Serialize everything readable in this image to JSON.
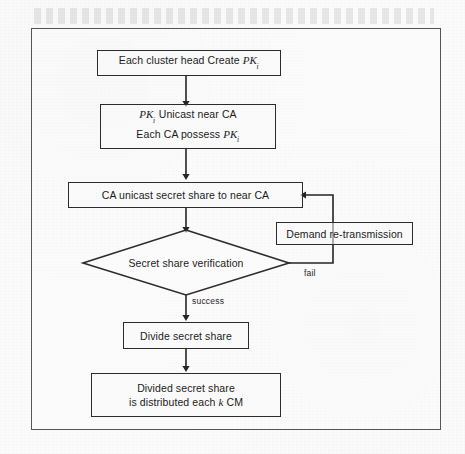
{
  "figure": {
    "type": "flowchart",
    "background_color": "#fbfbfb",
    "frame_color": "#555555",
    "node_border_color": "#2c2c2c",
    "text_color": "#1b1b1b"
  },
  "nodes": {
    "cluster_head_create": {
      "id": "n1",
      "shape": "rectangle",
      "line1_pre": "Each cluster head Create ",
      "line1_var": "PK",
      "line1_sub": "i"
    },
    "unicast_possess": {
      "id": "n2",
      "shape": "rectangle",
      "line1_var": "PK",
      "line1_sub": "i",
      "line1_post": "  Unicast near CA",
      "line2_pre": "Each CA possess  ",
      "line2_var": "PK",
      "line2_sub": "i"
    },
    "ca_unicast_secret_share": {
      "id": "n3",
      "shape": "rectangle",
      "label": "CA unicast secret share to near CA"
    },
    "demand_retransmission": {
      "id": "n4",
      "shape": "rectangle",
      "label": "Demand re-transmission"
    },
    "secret_share_verification": {
      "id": "n5",
      "shape": "diamond",
      "label": "Secret share verification"
    },
    "divide_secret_share": {
      "id": "n6",
      "shape": "rectangle",
      "label": "Divide secret share"
    },
    "divided_distributed": {
      "id": "n7",
      "shape": "rectangle",
      "line1": "Divided secret share",
      "line2_pre": "is distributed each ",
      "line2_var": "k",
      "line2_post": " CM"
    }
  },
  "edge_labels": {
    "fail": "fail",
    "success": "success"
  },
  "edges": [
    {
      "from": "n1",
      "to": "n2",
      "label": ""
    },
    {
      "from": "n2",
      "to": "n3",
      "label": ""
    },
    {
      "from": "n3",
      "to": "n5",
      "label": ""
    },
    {
      "from": "n5",
      "to": "n6",
      "label": "success"
    },
    {
      "from": "n5",
      "to": "n3",
      "label": "fail",
      "via": "n4"
    },
    {
      "from": "n6",
      "to": "n7",
      "label": ""
    }
  ]
}
